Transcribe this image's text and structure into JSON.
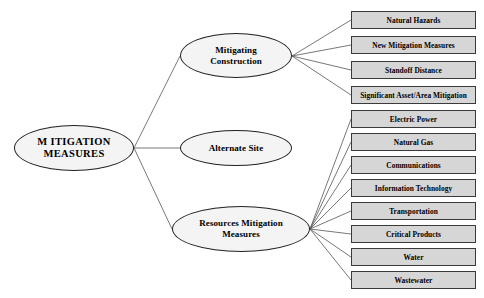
{
  "diagram": {
    "type": "tree",
    "orientation": "left-to-right",
    "colors": {
      "background": "#ffffff",
      "ellipse_fill": "#f4f4f4",
      "ellipse_stroke": "#222222",
      "box_fill": "#d6d6d6",
      "box_stroke": "#3a3a3a",
      "edge_stroke": "#555555",
      "text": "#000000"
    },
    "root": {
      "id": "mitigation-measures",
      "label": "M ITIGATION\nMEASURES",
      "line1": "M ITIGATION",
      "line2": "MEASURES",
      "shape": "ellipse"
    },
    "branches": [
      {
        "id": "mitigating-construction",
        "shape": "ellipse",
        "line1": "Mitigating",
        "line2": "Construction",
        "label": "Mitigating Construction",
        "children": [
          {
            "id": "natural-hazards",
            "label": "Natural Hazards"
          },
          {
            "id": "new-mitigation-measures",
            "label": "New Mitigation Measures"
          },
          {
            "id": "standoff-distance",
            "label": "Standoff Distance"
          },
          {
            "id": "significant-asset-area-mitigation",
            "label": "Significant Asset/Area Mitigation"
          }
        ]
      },
      {
        "id": "alternate-site",
        "shape": "ellipse",
        "line1": "Alternate Site",
        "line2": "",
        "label": "Alternate Site",
        "children": []
      },
      {
        "id": "resources-mitigation-measures",
        "shape": "ellipse",
        "line1": "Resources Mitigation",
        "line2": "Measures",
        "label": "Resources Mitigation Measures",
        "children": [
          {
            "id": "electric-power",
            "label": "Electric Power"
          },
          {
            "id": "natural-gas",
            "label": "Natural Gas"
          },
          {
            "id": "communications",
            "label": "Communications"
          },
          {
            "id": "information-technology",
            "label": "Information Technology"
          },
          {
            "id": "transportation",
            "label": "Transportation"
          },
          {
            "id": "critical-products",
            "label": "Critical Products"
          },
          {
            "id": "water",
            "label": "Water"
          },
          {
            "id": "wastewater",
            "label": "Wastewater"
          }
        ]
      }
    ]
  }
}
